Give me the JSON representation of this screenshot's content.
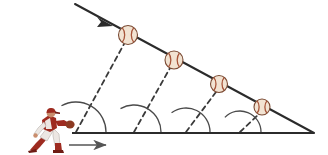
{
  "diagram": {
    "background_color": "#ffffff",
    "line_color": "#2b2b2b",
    "dashed_color": "#3a3a3a",
    "arc_color": "#4a4a4a",
    "ball_fill": "#f2e3d2",
    "ball_seam_color": "#a8553a",
    "ball_outline": "#7a4a33",
    "player": {
      "label": "baseball-player",
      "uniform_color": "#9e2b20",
      "uniform_shadow": "#6e1c14",
      "pants_color": "#ece7e3",
      "skin_color": "#c98d6d",
      "glove_color": "#8c3a22",
      "x": 26,
      "y": 106,
      "width": 48,
      "height": 48
    },
    "baseline": {
      "name": "ground-line",
      "x1": 72,
      "y1": 133,
      "x2": 314,
      "y2": 133,
      "stroke_width": 2.2
    },
    "trajectory": {
      "name": "trajectory-line",
      "x1": 75,
      "y1": 4,
      "x2": 314,
      "y2": 133,
      "stroke_width": 2.0,
      "arrow_at": {
        "x": 112,
        "y": 24
      },
      "arrow_direction": "down-right"
    },
    "motion_arrow": {
      "name": "motion-arrow",
      "x1": 69,
      "y1": 145,
      "x2": 106,
      "y2": 145,
      "direction": "right",
      "color": "#555555"
    },
    "balls": [
      {
        "name": "baseball-1",
        "cx": 128,
        "cy": 35,
        "r": 9.5
      },
      {
        "name": "baseball-2",
        "cx": 174,
        "cy": 60,
        "r": 9.0
      },
      {
        "name": "baseball-3",
        "cx": 219,
        "cy": 84,
        "r": 8.5
      },
      {
        "name": "baseball-4",
        "cx": 262,
        "cy": 107,
        "r": 8.0
      }
    ],
    "sight_lines": [
      {
        "name": "sight-line-1",
        "x1": 76,
        "y1": 132,
        "x2": 124,
        "y2": 44,
        "angle_radius": 30
      },
      {
        "name": "sight-line-2",
        "x1": 134,
        "y1": 132,
        "x2": 170,
        "y2": 68,
        "angle_radius": 27
      },
      {
        "name": "sight-line-3",
        "x1": 186,
        "y1": 132,
        "x2": 216,
        "y2": 92,
        "angle_radius": 24
      },
      {
        "name": "sight-line-4",
        "x1": 240,
        "y1": 132,
        "x2": 259,
        "y2": 114,
        "angle_radius": 21
      }
    ],
    "angles": [
      {
        "name": "angle-arc-1",
        "vertex_x": 76,
        "vertex_y": 132,
        "degrees": 61
      },
      {
        "name": "angle-arc-2",
        "vertex_x": 134,
        "vertex_y": 132,
        "degrees": 60
      },
      {
        "name": "angle-arc-3",
        "vertex_x": 186,
        "vertex_y": 132,
        "degrees": 53
      },
      {
        "name": "angle-arc-4",
        "vertex_x": 240,
        "vertex_y": 132,
        "degrees": 44
      }
    ]
  }
}
